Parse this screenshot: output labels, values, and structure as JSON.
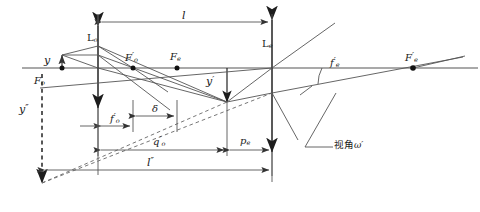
{
  "figure": {
    "type": "optical-ray-diagram",
    "background_color": "#ffffff",
    "line_color": "#3a3a3a",
    "text_color": "#1a1a1a"
  },
  "labels": {
    "lens_objective": "L",
    "lens_objective_sub": "o",
    "lens_eyepiece": "L",
    "lens_eyepiece_sub": "e",
    "object_height": "y",
    "image_height": "y",
    "image_height_prime": "′",
    "virtual_height": "y",
    "virtual_height_prime": "″",
    "focal_object_front": "F",
    "focal_object_front_sub": "o",
    "focal_object_back": "F",
    "focal_object_back_sub": "o",
    "focal_object_back_prime": "′",
    "focal_eyepiece_front": "F",
    "focal_eyepiece_front_sub": "e",
    "focal_eyepiece_back": "F",
    "focal_eyepiece_back_sub": "e",
    "focal_eyepiece_back_prime": "′",
    "focal_len_objective": "f",
    "focal_len_objective_sub": "o",
    "focal_len_objective_prime": "′",
    "focal_len_eyepiece": "f",
    "focal_len_eyepiece_sub": "e",
    "focal_len_eyepiece_prime": "′",
    "optical_interval": "δ",
    "lens_separation": "l",
    "image_distance_objective": "q",
    "image_distance_objective_sub": "o",
    "image_distance_objective_prime": "′",
    "object_distance_eyepiece": "p",
    "object_distance_eyepiece_sub": "e",
    "total_distance": "l",
    "total_distance_prime": "″",
    "view_angle": "视角",
    "view_angle_symbol": "ω′"
  },
  "geometry": {
    "axis_y": 68,
    "objective_x": 98,
    "eyepiece_x": 272,
    "focal_o_front_x": 62,
    "focal_o_back_x": 133,
    "focal_e_front_x": 177,
    "focal_e_back_x": 413,
    "object_top_y": 55,
    "image_y": 103,
    "virtual_image_x": 42,
    "virtual_image_y": 180
  }
}
